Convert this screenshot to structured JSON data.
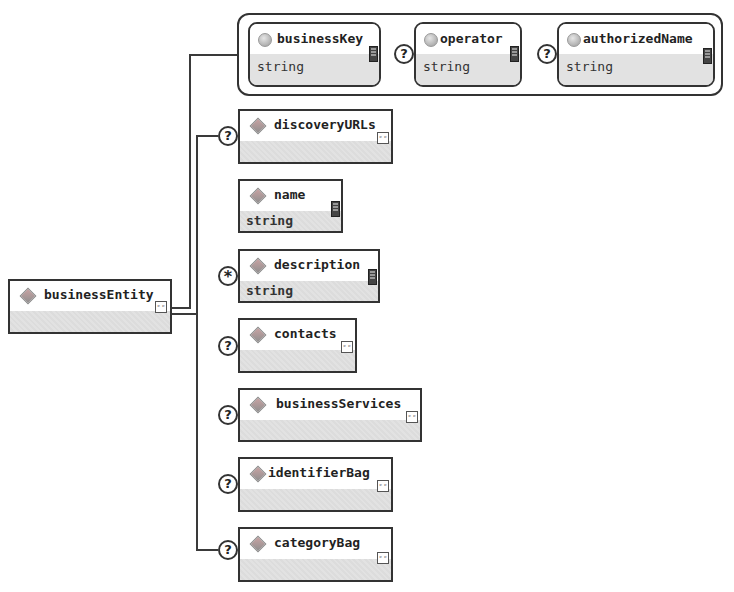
{
  "diagram": {
    "root": {
      "name": "businessEntity",
      "icon": "element-diamond-icon",
      "has_complex_type": true
    },
    "attributes": [
      {
        "name": "businessKey",
        "type": "string",
        "occurrence": ""
      },
      {
        "name": "operator",
        "type": "string",
        "occurrence": "?"
      },
      {
        "name": "authorizedName",
        "type": "string",
        "occurrence": "?"
      }
    ],
    "children": [
      {
        "name": "discoveryURLs",
        "type": "",
        "occurrence": "?",
        "complex": true
      },
      {
        "name": "name",
        "type": "string",
        "occurrence": "",
        "complex": false
      },
      {
        "name": "description",
        "type": "string",
        "occurrence": "*",
        "complex": false
      },
      {
        "name": "contacts",
        "type": "",
        "occurrence": "?",
        "complex": true
      },
      {
        "name": "businessServices",
        "type": "",
        "occurrence": "?",
        "complex": true
      },
      {
        "name": "identifierBag",
        "type": "",
        "occurrence": "?",
        "complex": true
      },
      {
        "name": "categoryBag",
        "type": "",
        "occurrence": "?",
        "complex": true
      }
    ],
    "icons": {
      "complex_type": "ᶜᶜ",
      "optional": "?",
      "many": "*"
    },
    "colors": {
      "border": "#333333",
      "body_fill": "#e0e0e0",
      "background": "#ffffff"
    }
  }
}
